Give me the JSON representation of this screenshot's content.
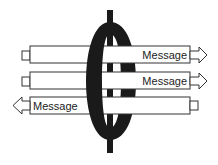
{
  "diagram": {
    "colors": {
      "ring": "#1a1a1a",
      "bar_fill": "#ffffff",
      "bar_stroke": "#333333",
      "text": "#222222"
    },
    "messages": [
      {
        "label": "Message",
        "direction": "right"
      },
      {
        "label": "Message",
        "direction": "right"
      },
      {
        "label": "Message",
        "direction": "left"
      }
    ]
  }
}
